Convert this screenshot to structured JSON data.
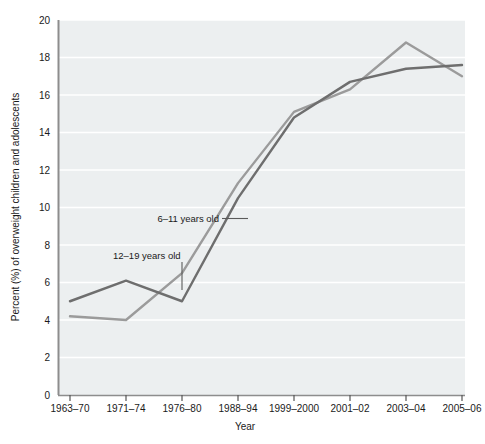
{
  "chart_data": {
    "type": "line",
    "title": "",
    "xlabel": "Year",
    "ylabel": "Percent (%) of overweight children and adolescents",
    "categories": [
      "1963–70",
      "1971–74",
      "1976–80",
      "1988–94",
      "1999–2000",
      "2001–02",
      "2003–04",
      "2005–06"
    ],
    "ylim": [
      0,
      20
    ],
    "yticks": [
      0,
      2,
      4,
      6,
      8,
      10,
      12,
      14,
      16,
      18,
      20
    ],
    "ytick_labels": [
      "0",
      "2",
      "4",
      "6",
      "8",
      "10",
      "12",
      "14",
      "16",
      "18",
      "20"
    ],
    "grid": true,
    "grid_color": "#ffffff",
    "plot_background": "#eceff0",
    "legend_position": "inline-annotation",
    "series": [
      {
        "name": "6–11 years old",
        "color": "#9b9b9b",
        "values": [
          4.2,
          4.0,
          6.5,
          11.3,
          15.1,
          16.3,
          18.8,
          17.0
        ],
        "annotation_label": "6–11 years old"
      },
      {
        "name": "12–19 years old",
        "color": "#6e6e6e",
        "values": [
          5.0,
          6.1,
          5.0,
          10.5,
          14.8,
          16.7,
          17.4,
          17.6
        ],
        "annotation_label": "12–19 years old"
      }
    ],
    "annotations": [
      {
        "text": "6–11 years old",
        "points_to_series": "6–11 years old"
      },
      {
        "text": "12–19 years old",
        "points_to_series": "12–19 years old"
      }
    ]
  }
}
